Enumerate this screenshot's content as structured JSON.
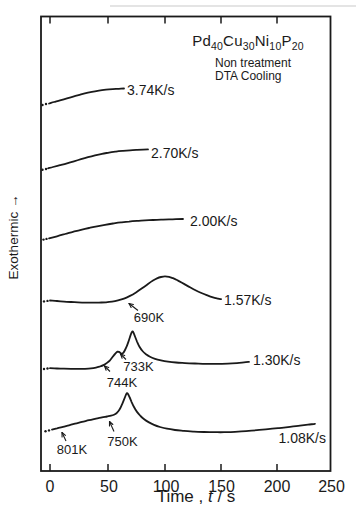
{
  "window": {
    "width": 357,
    "height": 528
  },
  "colors": {
    "ink": "#1a1a1a",
    "bg": "#ffffff",
    "scan_artifact": "#c9c9c9"
  },
  "header": {
    "formula": [
      {
        "text": "Pd",
        "sub": "40"
      },
      {
        "text": "Cu",
        "sub": "30"
      },
      {
        "text": "Ni",
        "sub": "10"
      },
      {
        "text": "P",
        "sub": "20"
      }
    ],
    "notes": [
      "Non treatment",
      "DTA Cooling"
    ]
  },
  "axes": {
    "ylabel": "Exothermic →",
    "xlabel_parts": [
      {
        "text": "Time , ",
        "italic": false
      },
      {
        "text": "t",
        "italic": true
      },
      {
        "text": " / s",
        "italic": false
      }
    ],
    "plot_box_px": {
      "left": 41,
      "top": 16.5,
      "right": 330.5,
      "bottom": 471
    },
    "tick_len_px": 7,
    "tick_marks_px": [
      50,
      108,
      165,
      221,
      277
    ],
    "x_tick_labels": [
      {
        "label": "0",
        "px": 50
      },
      {
        "label": "50",
        "px": 109
      },
      {
        "label": "100",
        "px": 166
      },
      {
        "label": "150",
        "px": 221.5
      },
      {
        "label": "200",
        "px": 277
      },
      {
        "label": "250",
        "px": 331.5
      }
    ],
    "tick_label_y_px": 478,
    "ylabel_center_px": {
      "x": 13,
      "y": 237
    },
    "xlabel_center_px": {
      "x": 196,
      "y": 495
    }
  },
  "chart_data": {
    "type": "line",
    "xlabel": "Time, t / s",
    "ylabel": "Exothermic (arbitrary units, increasing upward)",
    "xlim": [
      -8,
      250
    ],
    "x_ticks": [
      0,
      50,
      100,
      150,
      200,
      250
    ],
    "grid": false,
    "legend": "each curve labeled at its right end with cooling rate",
    "series": [
      {
        "name": "3.74K/s",
        "label_px": {
          "x": 127,
          "y": 90
        },
        "lead_dots_px": [
          [
            42.5,
            105
          ],
          [
            46,
            104
          ]
        ],
        "points_px": [
          [
            49,
            103.5
          ],
          [
            54,
            102
          ],
          [
            60,
            100.3
          ],
          [
            67,
            98.3
          ],
          [
            74,
            96.3
          ],
          [
            81,
            94.4
          ],
          [
            88,
            92.7
          ],
          [
            95,
            91.3
          ],
          [
            102,
            90.2
          ],
          [
            109,
            89.4
          ],
          [
            116,
            88.9
          ],
          [
            121,
            88.6
          ],
          [
            124,
            88.5
          ]
        ]
      },
      {
        "name": "2.70K/s",
        "label_px": {
          "x": 151,
          "y": 153
        },
        "lead_dots_px": [
          [
            42.5,
            169.8
          ],
          [
            46,
            169
          ]
        ],
        "points_px": [
          [
            48,
            168.3
          ],
          [
            53,
            167
          ],
          [
            60,
            165.2
          ],
          [
            67,
            163.3
          ],
          [
            74,
            161.3
          ],
          [
            81,
            159.2
          ],
          [
            88,
            157.2
          ],
          [
            95,
            155.4
          ],
          [
            102,
            153.8
          ],
          [
            109,
            152.6
          ],
          [
            116,
            151.6
          ],
          [
            123,
            150.9
          ],
          [
            130,
            150.3
          ],
          [
            137,
            149.9
          ],
          [
            143,
            149.6
          ],
          [
            148,
            149.4
          ]
        ]
      },
      {
        "name": "2.00K/s",
        "label_px": {
          "x": 190,
          "y": 221
        },
        "lead_dots_px": [
          [
            43.5,
            239.6
          ],
          [
            46.5,
            238.9
          ]
        ],
        "points_px": [
          [
            49,
            238.3
          ],
          [
            57,
            236.3
          ],
          [
            65,
            234
          ],
          [
            73,
            231.8
          ],
          [
            81,
            229.8
          ],
          [
            89,
            228
          ],
          [
            97,
            226.3
          ],
          [
            105,
            224.8
          ],
          [
            113,
            223.5
          ],
          [
            121,
            222.4
          ],
          [
            129,
            221.6
          ],
          [
            137,
            220.9
          ],
          [
            145,
            220.4
          ],
          [
            153,
            220
          ],
          [
            161,
            219.7
          ],
          [
            169,
            219.4
          ],
          [
            176,
            219.2
          ],
          [
            183,
            219
          ]
        ]
      },
      {
        "name": "1.57K/s",
        "label_px": {
          "x": 224,
          "y": 300
        },
        "lead_dots_px": [
          [
            44,
            301.4
          ],
          [
            47.5,
            300.9
          ]
        ],
        "points_px": [
          [
            50,
            300.5
          ],
          [
            57,
            301
          ],
          [
            64,
            301.6
          ],
          [
            71,
            302
          ],
          [
            78,
            302.4
          ],
          [
            85,
            302.6
          ],
          [
            92,
            302.7
          ],
          [
            99,
            302.6
          ],
          [
            106,
            302.3
          ],
          [
            112,
            301.6
          ],
          [
            118,
            300.4
          ],
          [
            124,
            298.6
          ],
          [
            130,
            295.9
          ],
          [
            136,
            292.4
          ],
          [
            142,
            288.3
          ],
          [
            148,
            284
          ],
          [
            153,
            280.6
          ],
          [
            157,
            278.4
          ],
          [
            161,
            277
          ],
          [
            165,
            276.4
          ],
          [
            169,
            276.8
          ],
          [
            173,
            278.2
          ],
          [
            178,
            280.6
          ],
          [
            184,
            283.9
          ],
          [
            190,
            287.3
          ],
          [
            196,
            290.5
          ],
          [
            202,
            293.3
          ],
          [
            208,
            295.7
          ],
          [
            213,
            297.4
          ],
          [
            218,
            298.6
          ],
          [
            221,
            299.2
          ]
        ]
      },
      {
        "name": "1.30K/s",
        "label_px": {
          "x": 253,
          "y": 359.5
        },
        "lead_dots_px": [
          [
            44,
            369
          ],
          [
            47.5,
            368.5
          ]
        ],
        "points_px": [
          [
            50,
            368.2
          ],
          [
            57,
            368.5
          ],
          [
            64,
            368.7
          ],
          [
            71,
            368.8
          ],
          [
            78,
            368.9
          ],
          [
            85,
            368.8
          ],
          [
            91,
            368.4
          ],
          [
            96,
            367.6
          ],
          [
            100,
            366.5
          ],
          [
            104,
            364.9
          ],
          [
            107,
            362.9
          ],
          [
            110,
            360.3
          ],
          [
            112,
            357.8
          ],
          [
            114,
            355.2
          ],
          [
            116,
            352.8
          ],
          [
            117.5,
            351.6
          ],
          [
            119,
            351.9
          ],
          [
            120.5,
            353
          ],
          [
            122,
            353.6
          ],
          [
            123.5,
            352.6
          ],
          [
            125,
            350
          ],
          [
            127,
            345.6
          ],
          [
            129,
            340
          ],
          [
            130.5,
            335.4
          ],
          [
            131.8,
            332.2
          ],
          [
            132.6,
            331.3
          ],
          [
            133.6,
            332.8
          ],
          [
            135,
            336.5
          ],
          [
            137,
            341.6
          ],
          [
            139.5,
            346.8
          ],
          [
            142.5,
            351
          ],
          [
            146,
            354.3
          ],
          [
            150,
            356.8
          ],
          [
            155,
            358.8
          ],
          [
            161,
            360.4
          ],
          [
            168,
            361.6
          ],
          [
            176,
            362.5
          ],
          [
            185,
            363.1
          ],
          [
            195,
            363.5
          ],
          [
            206,
            363.8
          ],
          [
            217,
            363.8
          ],
          [
            228,
            363.6
          ],
          [
            237,
            363.1
          ],
          [
            244,
            362.4
          ],
          [
            249,
            361.8
          ]
        ]
      },
      {
        "name": "1.08K/s",
        "label_px": {
          "x": 278.5,
          "y": 437.5
        },
        "lead_dots_px": [
          [
            45.5,
            431.3
          ],
          [
            49,
            430.4
          ]
        ],
        "points_px": [
          [
            52,
            429.6
          ],
          [
            57,
            428.4
          ],
          [
            63,
            426.9
          ],
          [
            69,
            425.3
          ],
          [
            75,
            423.7
          ],
          [
            82,
            421.9
          ],
          [
            89,
            420.2
          ],
          [
            96,
            418.6
          ],
          [
            102,
            417.4
          ],
          [
            107,
            416.5
          ],
          [
            111,
            415.7
          ],
          [
            114,
            414.7
          ],
          [
            116.5,
            413.2
          ],
          [
            118.5,
            411
          ],
          [
            120.5,
            407.7
          ],
          [
            122.5,
            403.3
          ],
          [
            124.5,
            398.3
          ],
          [
            126,
            394.6
          ],
          [
            127,
            393.2
          ],
          [
            128,
            394
          ],
          [
            129.5,
            397
          ],
          [
            131.5,
            401.8
          ],
          [
            134,
            407
          ],
          [
            137,
            411.9
          ],
          [
            140.5,
            416
          ],
          [
            144.5,
            419.5
          ],
          [
            149,
            422.4
          ],
          [
            154,
            424.9
          ],
          [
            160,
            427
          ],
          [
            167,
            428.7
          ],
          [
            175,
            430
          ],
          [
            184,
            430.9
          ],
          [
            194,
            431.6
          ],
          [
            204,
            432
          ],
          [
            214,
            432.2
          ],
          [
            224,
            432.2
          ],
          [
            235,
            431.8
          ],
          [
            246,
            431.1
          ],
          [
            257,
            430.2
          ],
          [
            268,
            429.2
          ],
          [
            279,
            428.1
          ],
          [
            290,
            426.9
          ],
          [
            300,
            425.7
          ],
          [
            308,
            424.7
          ],
          [
            315,
            423.8
          ]
        ]
      }
    ],
    "annotations": [
      {
        "text": "690K",
        "series": "1.57K/s",
        "text_center_px": {
          "x": 149,
          "y": 317
        },
        "arrow_from_px": [
          138,
          310.5
        ],
        "arrow_to_px": [
          129,
          303.5
        ]
      },
      {
        "text": "744K",
        "series": "1.30K/s",
        "text_center_px": {
          "x": 122,
          "y": 381.7
        },
        "arrow_from_px": [
          110,
          371.5
        ],
        "arrow_to_px": [
          104.5,
          366
        ]
      },
      {
        "text": "733K",
        "series": "1.30K/s",
        "text_center_px": {
          "x": 138.4,
          "y": 365.7
        },
        "arrow_from_px": [
          126,
          359.5
        ],
        "arrow_to_px": [
          120.5,
          354
        ]
      },
      {
        "text": "750K",
        "series": "1.08K/s",
        "text_center_px": {
          "x": 122.5,
          "y": 440.7
        },
        "arrow_from_px": [
          114,
          431.5
        ],
        "arrow_to_px": [
          109.5,
          421.5
        ]
      },
      {
        "text": "801K",
        "series": "1.08K/s",
        "text_center_px": {
          "x": 72,
          "y": 449
        },
        "arrow_from_px": [
          66,
          441
        ],
        "arrow_to_px": [
          62,
          432.5
        ]
      }
    ],
    "scan_artifact_line_px": {
      "x1": 110,
      "y1": 6,
      "x2": 356,
      "y2": 6
    }
  }
}
